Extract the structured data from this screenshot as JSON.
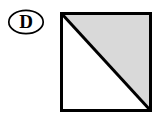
{
  "figure": {
    "background_color": "#ffffff",
    "label": {
      "text": "D",
      "shape": "ellipse",
      "text_color": "#000000",
      "outline_color": "#000000"
    },
    "diagram": {
      "type": "square-with-diagonal",
      "outline_color": "#000000",
      "outline_width": 3,
      "diagonal": {
        "from": "top-left",
        "to": "bottom-right",
        "color": "#000000",
        "width": 3
      },
      "regions": [
        {
          "name": "upper-right-triangle",
          "fill": "#d9d9d9",
          "shaded": "shaded"
        },
        {
          "name": "lower-left-triangle",
          "fill": "#ffffff",
          "shaded": "unshaded"
        }
      ]
    }
  }
}
